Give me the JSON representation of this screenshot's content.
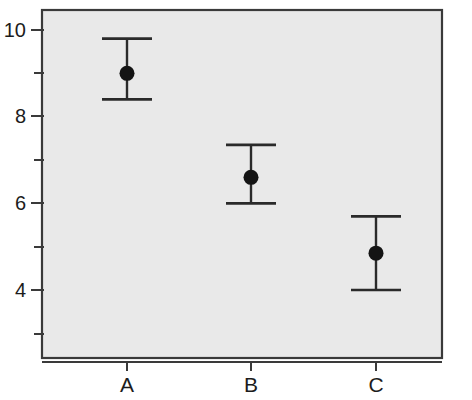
{
  "chart_data": {
    "type": "scatter",
    "title": "",
    "subtitle": "",
    "xlabel": "",
    "ylabel": "",
    "categories": [
      "A",
      "B",
      "C"
    ],
    "values": [
      9.0,
      6.6,
      4.85
    ],
    "error_low": [
      8.4,
      6.0,
      4.0
    ],
    "error_high": [
      9.8,
      7.35,
      5.7
    ],
    "series": [
      {
        "name": "mean",
        "values": [
          9.0,
          6.6,
          4.85
        ]
      }
    ],
    "points": [
      {
        "category": "A",
        "value": 9.0,
        "lower": 8.4,
        "upper": 9.8
      },
      {
        "category": "B",
        "value": 6.6,
        "lower": 6.0,
        "upper": 7.35
      },
      {
        "category": "C",
        "value": 4.85,
        "lower": 4.0,
        "upper": 5.7
      }
    ],
    "ylim": [
      2.9,
      10.45
    ],
    "y_major_ticks": [
      10,
      8,
      6,
      4
    ],
    "y_major_tick_labels": [
      "10",
      "8",
      "6",
      "4"
    ],
    "y_minor_ticks": [
      9,
      7,
      5,
      3
    ],
    "grid": false,
    "legend": null,
    "legend_position": "none",
    "annotations": [],
    "marker": "filled-circle",
    "errorbar_style": "capped-whisker",
    "colors": {
      "panel_background": "#e9e9e9",
      "panel_border": "#3a3a3a",
      "marker": "#141414",
      "errorbar": "#2a2a2a",
      "axis": "#3a3a3a",
      "text": "#1c1c1c",
      "page_background": "#ffffff"
    }
  },
  "axes": {
    "y_axis_name": "y-axis",
    "x_axis_name": "x-axis"
  }
}
